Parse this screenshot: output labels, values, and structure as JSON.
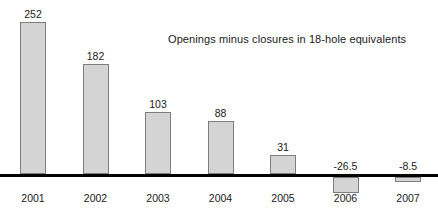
{
  "chart_data": {
    "type": "bar",
    "title": "",
    "subtitle": "",
    "annotation": "Openings minus closures in 18-hole equivalents",
    "categories": [
      "2001",
      "2002",
      "2003",
      "2004",
      "2005",
      "2006",
      "2007"
    ],
    "values": [
      252,
      182,
      103,
      88,
      31,
      -26.5,
      -8.5
    ],
    "value_labels": [
      "252",
      "182",
      "103",
      "88",
      "31",
      "-26.5",
      "-8.5"
    ],
    "xlabel": "",
    "ylabel": "",
    "ylim": [
      -60,
      270
    ],
    "grid": false,
    "legend": null,
    "legend_position": "none",
    "zero_line": true,
    "axis_visible": false,
    "bar_fill_color": "#d4d4d4",
    "bar_border_color": "#7d7d7d",
    "zero_line_color": "#000000",
    "text_color": "#1a1a1a",
    "background_color": "#ffffff"
  }
}
